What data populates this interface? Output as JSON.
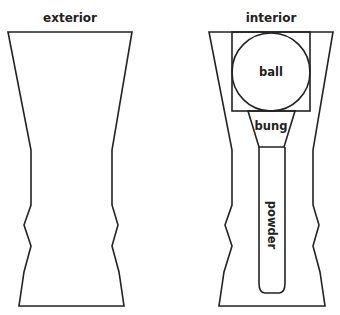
{
  "panels": {
    "exterior": {
      "title": "exterior",
      "outline_points": "8,32 132,32 112,150 112,205 118,225 112,246 119,272 124,306 19,306 24,272 31,246 24,225 31,205 31,150"
    },
    "interior": {
      "title": "interior",
      "outline_points": "209,32 333,32 313,150 313,205 319,225 313,246 320,272 325,306 219,306 224,272 232,246 225,225 232,205 232,150",
      "parts": {
        "ball": {
          "label": "ball"
        },
        "bung": {
          "label": "bung"
        },
        "powder": {
          "label": "powder"
        }
      }
    }
  },
  "colors": {
    "stroke": "#222222",
    "background": "#ffffff"
  }
}
